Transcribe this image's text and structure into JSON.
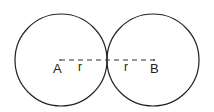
{
  "diagram": {
    "circles": [
      {
        "center_label": "A",
        "cx": 60,
        "cy": 60,
        "r": 46
      },
      {
        "center_label": "B",
        "cx": 152,
        "cy": 60,
        "r": 46
      }
    ],
    "segment_labels": [
      "r",
      "r"
    ],
    "stroke_color": "#222222"
  }
}
